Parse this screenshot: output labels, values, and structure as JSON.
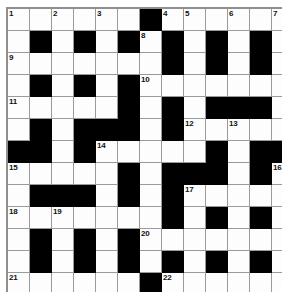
{
  "puzzle": {
    "kind": "crossword-grid",
    "columns": 12,
    "rows": 13,
    "cell_size_px": 21,
    "colors": {
      "block": "#000000",
      "cell": "#fdfdfd",
      "gridline": "#9a9a9a",
      "number": "#111111",
      "background": "#ffffff"
    },
    "clue_numbers_visible": [
      1,
      2,
      3,
      4,
      5,
      6,
      7,
      8,
      9,
      10,
      11,
      12,
      13,
      14,
      15,
      16,
      17,
      18,
      19,
      20,
      21,
      22
    ],
    "grid": [
      [
        {
          "block": false,
          "num": "1"
        },
        {
          "block": false,
          "num": ""
        },
        {
          "block": false,
          "num": "2"
        },
        {
          "block": false,
          "num": ""
        },
        {
          "block": false,
          "num": "3"
        },
        {
          "block": false,
          "num": ""
        },
        {
          "block": true,
          "num": ""
        },
        {
          "block": false,
          "num": "4"
        },
        {
          "block": false,
          "num": "5"
        },
        {
          "block": false,
          "num": ""
        },
        {
          "block": false,
          "num": "6"
        },
        {
          "block": false,
          "num": ""
        },
        {
          "block": false,
          "num": "7"
        }
      ],
      [
        {
          "block": false,
          "num": ""
        },
        {
          "block": true,
          "num": ""
        },
        {
          "block": false,
          "num": ""
        },
        {
          "block": true,
          "num": ""
        },
        {
          "block": false,
          "num": ""
        },
        {
          "block": true,
          "num": ""
        },
        {
          "block": false,
          "num": "8"
        },
        {
          "block": true,
          "num": ""
        },
        {
          "block": false,
          "num": ""
        },
        {
          "block": true,
          "num": ""
        },
        {
          "block": false,
          "num": ""
        },
        {
          "block": true,
          "num": ""
        },
        {
          "block": false,
          "num": ""
        }
      ],
      [
        {
          "block": false,
          "num": "9"
        },
        {
          "block": false,
          "num": ""
        },
        {
          "block": false,
          "num": ""
        },
        {
          "block": false,
          "num": ""
        },
        {
          "block": false,
          "num": ""
        },
        {
          "block": false,
          "num": ""
        },
        {
          "block": false,
          "num": ""
        },
        {
          "block": true,
          "num": ""
        },
        {
          "block": false,
          "num": ""
        },
        {
          "block": true,
          "num": ""
        },
        {
          "block": false,
          "num": ""
        },
        {
          "block": true,
          "num": ""
        },
        {
          "block": false,
          "num": ""
        }
      ],
      [
        {
          "block": false,
          "num": ""
        },
        {
          "block": true,
          "num": ""
        },
        {
          "block": false,
          "num": ""
        },
        {
          "block": true,
          "num": ""
        },
        {
          "block": false,
          "num": ""
        },
        {
          "block": true,
          "num": ""
        },
        {
          "block": false,
          "num": "10"
        },
        {
          "block": false,
          "num": ""
        },
        {
          "block": false,
          "num": ""
        },
        {
          "block": false,
          "num": ""
        },
        {
          "block": false,
          "num": ""
        },
        {
          "block": false,
          "num": ""
        },
        {
          "block": false,
          "num": ""
        }
      ],
      [
        {
          "block": false,
          "num": "11"
        },
        {
          "block": false,
          "num": ""
        },
        {
          "block": false,
          "num": ""
        },
        {
          "block": false,
          "num": ""
        },
        {
          "block": false,
          "num": ""
        },
        {
          "block": true,
          "num": ""
        },
        {
          "block": false,
          "num": ""
        },
        {
          "block": true,
          "num": ""
        },
        {
          "block": false,
          "num": ""
        },
        {
          "block": true,
          "num": ""
        },
        {
          "block": true,
          "num": ""
        },
        {
          "block": true,
          "num": ""
        },
        {
          "block": false,
          "num": ""
        }
      ],
      [
        {
          "block": false,
          "num": ""
        },
        {
          "block": true,
          "num": ""
        },
        {
          "block": false,
          "num": ""
        },
        {
          "block": true,
          "num": ""
        },
        {
          "block": true,
          "num": ""
        },
        {
          "block": true,
          "num": ""
        },
        {
          "block": false,
          "num": ""
        },
        {
          "block": true,
          "num": ""
        },
        {
          "block": false,
          "num": "12"
        },
        {
          "block": false,
          "num": ""
        },
        {
          "block": false,
          "num": "13"
        },
        {
          "block": false,
          "num": ""
        },
        {
          "block": false,
          "num": ""
        }
      ],
      [
        {
          "block": true,
          "num": ""
        },
        {
          "block": true,
          "num": ""
        },
        {
          "block": false,
          "num": ""
        },
        {
          "block": true,
          "num": ""
        },
        {
          "block": false,
          "num": "14"
        },
        {
          "block": false,
          "num": ""
        },
        {
          "block": false,
          "num": ""
        },
        {
          "block": false,
          "num": ""
        },
        {
          "block": false,
          "num": ""
        },
        {
          "block": true,
          "num": ""
        },
        {
          "block": false,
          "num": ""
        },
        {
          "block": true,
          "num": ""
        },
        {
          "block": true,
          "num": ""
        }
      ],
      [
        {
          "block": false,
          "num": "15"
        },
        {
          "block": false,
          "num": ""
        },
        {
          "block": false,
          "num": ""
        },
        {
          "block": false,
          "num": ""
        },
        {
          "block": false,
          "num": ""
        },
        {
          "block": true,
          "num": ""
        },
        {
          "block": false,
          "num": ""
        },
        {
          "block": true,
          "num": ""
        },
        {
          "block": true,
          "num": ""
        },
        {
          "block": true,
          "num": ""
        },
        {
          "block": false,
          "num": ""
        },
        {
          "block": true,
          "num": ""
        },
        {
          "block": false,
          "num": "16"
        }
      ],
      [
        {
          "block": false,
          "num": ""
        },
        {
          "block": true,
          "num": ""
        },
        {
          "block": true,
          "num": ""
        },
        {
          "block": true,
          "num": ""
        },
        {
          "block": false,
          "num": ""
        },
        {
          "block": true,
          "num": ""
        },
        {
          "block": false,
          "num": ""
        },
        {
          "block": true,
          "num": ""
        },
        {
          "block": false,
          "num": "17"
        },
        {
          "block": false,
          "num": ""
        },
        {
          "block": false,
          "num": ""
        },
        {
          "block": false,
          "num": ""
        },
        {
          "block": false,
          "num": ""
        }
      ],
      [
        {
          "block": false,
          "num": "18"
        },
        {
          "block": false,
          "num": ""
        },
        {
          "block": false,
          "num": "19"
        },
        {
          "block": false,
          "num": ""
        },
        {
          "block": false,
          "num": ""
        },
        {
          "block": false,
          "num": ""
        },
        {
          "block": false,
          "num": ""
        },
        {
          "block": true,
          "num": ""
        },
        {
          "block": false,
          "num": ""
        },
        {
          "block": true,
          "num": ""
        },
        {
          "block": false,
          "num": ""
        },
        {
          "block": true,
          "num": ""
        },
        {
          "block": false,
          "num": ""
        }
      ],
      [
        {
          "block": false,
          "num": ""
        },
        {
          "block": true,
          "num": ""
        },
        {
          "block": false,
          "num": ""
        },
        {
          "block": true,
          "num": ""
        },
        {
          "block": false,
          "num": ""
        },
        {
          "block": true,
          "num": ""
        },
        {
          "block": false,
          "num": "20"
        },
        {
          "block": false,
          "num": ""
        },
        {
          "block": false,
          "num": ""
        },
        {
          "block": false,
          "num": ""
        },
        {
          "block": false,
          "num": ""
        },
        {
          "block": false,
          "num": ""
        },
        {
          "block": false,
          "num": ""
        }
      ],
      [
        {
          "block": false,
          "num": ""
        },
        {
          "block": true,
          "num": ""
        },
        {
          "block": false,
          "num": ""
        },
        {
          "block": true,
          "num": ""
        },
        {
          "block": false,
          "num": ""
        },
        {
          "block": true,
          "num": ""
        },
        {
          "block": false,
          "num": ""
        },
        {
          "block": true,
          "num": ""
        },
        {
          "block": false,
          "num": ""
        },
        {
          "block": true,
          "num": ""
        },
        {
          "block": false,
          "num": ""
        },
        {
          "block": true,
          "num": ""
        },
        {
          "block": false,
          "num": ""
        }
      ],
      [
        {
          "block": false,
          "num": "21"
        },
        {
          "block": false,
          "num": ""
        },
        {
          "block": false,
          "num": ""
        },
        {
          "block": false,
          "num": ""
        },
        {
          "block": false,
          "num": ""
        },
        {
          "block": false,
          "num": ""
        },
        {
          "block": true,
          "num": ""
        },
        {
          "block": false,
          "num": "22"
        },
        {
          "block": false,
          "num": ""
        },
        {
          "block": false,
          "num": ""
        },
        {
          "block": false,
          "num": ""
        },
        {
          "block": false,
          "num": ""
        },
        {
          "block": false,
          "num": ""
        }
      ]
    ]
  }
}
